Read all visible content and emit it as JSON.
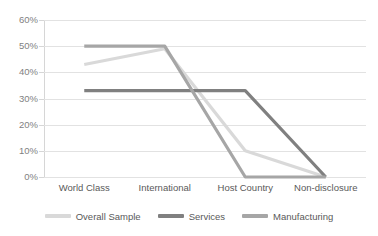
{
  "chart_data": {
    "type": "line",
    "title": "",
    "xlabel": "",
    "ylabel": "",
    "categories": [
      "World Class",
      "International",
      "Host Country",
      "Non-disclosure"
    ],
    "ylim": [
      0,
      60
    ],
    "yticks": [
      0,
      10,
      20,
      30,
      40,
      50,
      60
    ],
    "ytick_labels": [
      "0%",
      "10%",
      "20%",
      "30%",
      "40%",
      "50%",
      "60%"
    ],
    "grid": "horizontal",
    "legend_position": "bottom",
    "series": [
      {
        "name": "Overall Sample",
        "values": [
          43,
          49,
          10,
          0
        ],
        "color": "#d9d9d9"
      },
      {
        "name": "Services",
        "values": [
          33,
          33,
          33,
          0
        ],
        "color": "#808080"
      },
      {
        "name": "Manufacturing",
        "values": [
          50,
          50,
          0,
          0
        ],
        "color": "#a6a6a6"
      }
    ]
  },
  "axis": {
    "y_tick_labels": [
      "60%",
      "50%",
      "40%",
      "30%",
      "20%",
      "10%",
      "0%"
    ],
    "x_tick_labels": [
      "World Class",
      "International",
      "Host Country",
      "Non-disclosure"
    ]
  },
  "legend": {
    "items": [
      {
        "label": "Overall Sample"
      },
      {
        "label": "Services"
      },
      {
        "label": "Manufacturing"
      }
    ]
  }
}
